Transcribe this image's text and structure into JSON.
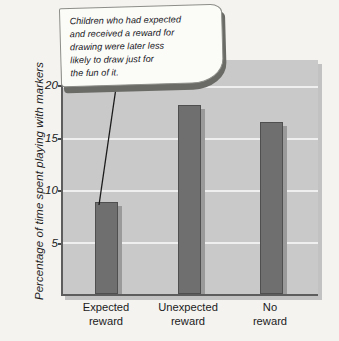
{
  "chart_data": {
    "type": "bar",
    "title": "",
    "xlabel": "",
    "ylabel": "Percentage of time spent playing with markers",
    "categories": [
      "Expected reward",
      "Unexpected reward",
      "No reward"
    ],
    "category_lines": [
      [
        "Expected",
        "reward"
      ],
      [
        "Unexpected",
        "reward"
      ],
      [
        "No",
        "reward"
      ]
    ],
    "values": [
      8.8,
      18.2,
      16.5
    ],
    "ylim": [
      0,
      22.5
    ],
    "yticks": [
      5,
      10,
      15,
      20
    ],
    "ytick_labels": [
      "5",
      "10",
      "15",
      "20"
    ],
    "grid": true,
    "legend": "none",
    "annotations": [
      {
        "text": "Children who had expected and received a reward for drawing were later less likely to draw just for the fun of it.",
        "lines": [
          "Children who had expected",
          "and received a reward for",
          "drawing were later less",
          "likely to draw just for",
          "the fun of it."
        ],
        "points_to": "Expected reward"
      }
    ],
    "colors": {
      "bar_fill": "#6f6f6f",
      "bar_edge": "#4f4f4f",
      "bar_shadow": "#9a9a9a",
      "plot_background": "#c9c9c9",
      "gridline": "#efefef",
      "axis": "#5d5d5d",
      "page_background": "#f4f3f0",
      "callout_fill": "#fbfbf8",
      "callout_shadow": "#6a6a66",
      "text": "#1b1b1b"
    }
  }
}
